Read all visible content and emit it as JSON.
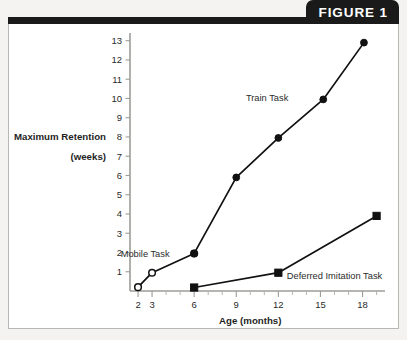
{
  "figure": {
    "tab_label": "FIGURE 1"
  },
  "chart_data": {
    "type": "line",
    "title": "",
    "xlabel": "Age (months)",
    "ylabel_line1": "Maximum Retention",
    "ylabel_line2": "(weeks)",
    "xlim": [
      1,
      19.6
    ],
    "ylim": [
      0,
      13.4
    ],
    "xticks": [
      2,
      3,
      6,
      9,
      12,
      15,
      18
    ],
    "xtick_labels": [
      "2",
      "3",
      "6",
      "9",
      "12",
      "15",
      "18"
    ],
    "x_minor_ticks": [
      4,
      5,
      7,
      8,
      10,
      11,
      13,
      14,
      16,
      17,
      19
    ],
    "yticks": [
      1,
      2,
      3,
      4,
      5,
      6,
      7,
      8,
      9,
      10,
      11,
      12,
      13
    ],
    "ytick_labels": [
      "1",
      "2",
      "3",
      "4",
      "5",
      "6",
      "7",
      "8",
      "9",
      "10",
      "11",
      "12",
      "13"
    ],
    "grid": false,
    "legend_position": "inline-annotations",
    "series": [
      {
        "name": "Mobile Task",
        "marker": "open-circle",
        "label": "Mobile Task",
        "label_x": 4.25,
        "label_y": 1.95,
        "label_anchor": "end",
        "x": [
          2,
          3,
          6
        ],
        "y": [
          0.2,
          0.95,
          1.95
        ]
      },
      {
        "name": "Train Task",
        "marker": "filled-circle",
        "label": "Train Task",
        "label_x": 11.2,
        "label_y": 10.05,
        "label_anchor": "middle",
        "x": [
          6,
          9,
          12,
          15.2,
          18.1
        ],
        "y": [
          1.95,
          5.9,
          7.95,
          9.95,
          12.9
        ]
      },
      {
        "name": "Deferred Imitation Task",
        "marker": "filled-square",
        "label": "Deferred Imitation Task",
        "label_x": 12.6,
        "label_y": 0.78,
        "label_anchor": "start",
        "x": [
          6,
          12,
          19.0
        ],
        "y": [
          0.18,
          0.95,
          3.9
        ]
      }
    ]
  },
  "colors": {
    "ink": "#111111",
    "axis": "#9d9c99",
    "tab_bg": "#1a1a1a",
    "tab_text": "#ffffff",
    "card_bg": "#ffffff",
    "page_bg": "#f4f3f1"
  }
}
